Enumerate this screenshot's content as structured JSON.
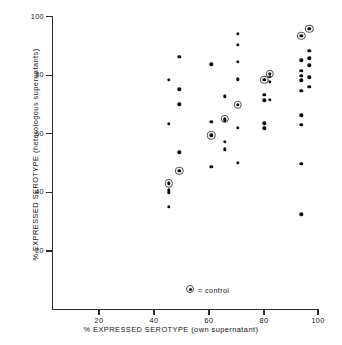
{
  "chart_data": {
    "type": "scatter",
    "title": "",
    "xlabel": "% EXPRESSED SEROTYPE (own supernatant)",
    "ylabel": "% EXPRESSED SEROTYPE (heterologous supernatants)",
    "xlim": [
      0,
      100
    ],
    "ylim": [
      0,
      100
    ],
    "xticks": [
      20,
      40,
      60,
      80,
      100
    ],
    "yticks": [
      20,
      40,
      60,
      80,
      100
    ],
    "xtick_labels": [
      "20",
      "40",
      "60",
      "80",
      "100"
    ],
    "ytick_labels": [
      "20",
      "40",
      "60",
      "80",
      "100"
    ],
    "grid": false,
    "legend_position": "inside-bottom-center",
    "legend": [
      {
        "marker": "circled-dot",
        "label": "= control"
      }
    ],
    "series": [
      {
        "name": "samples",
        "marker": "filled-dot",
        "color": "#0d0d0d",
        "points": [
          [
            44,
            78.3
          ],
          [
            44,
            63.2
          ],
          [
            44,
            42.9
          ],
          [
            44,
            40.6
          ],
          [
            44,
            39.7
          ],
          [
            44,
            34.8
          ],
          [
            48,
            86.0
          ],
          [
            48,
            75.0
          ],
          [
            48,
            69.8
          ],
          [
            48,
            53.4
          ],
          [
            48,
            47.2
          ],
          [
            60,
            83.5
          ],
          [
            60,
            63.9
          ],
          [
            60,
            59.3
          ],
          [
            60,
            48.5
          ],
          [
            65,
            72.5
          ],
          [
            65,
            64.8
          ],
          [
            65,
            64.3
          ],
          [
            65,
            57.0
          ],
          [
            65,
            54.5
          ],
          [
            70,
            94.0
          ],
          [
            70,
            90.2
          ],
          [
            70,
            84.3
          ],
          [
            70,
            78.4
          ],
          [
            70,
            69.7
          ],
          [
            70,
            61.8
          ],
          [
            70,
            49.8
          ],
          [
            80,
            78.2
          ],
          [
            80,
            73.0
          ],
          [
            80,
            71.2
          ],
          [
            80,
            63.3
          ],
          [
            80,
            61.6
          ],
          [
            82,
            80.3
          ],
          [
            82,
            79.2
          ],
          [
            82,
            77.5
          ],
          [
            82,
            71.3
          ],
          [
            94,
            93.2
          ],
          [
            94,
            84.9
          ],
          [
            94,
            81.2
          ],
          [
            94,
            79.6
          ],
          [
            94,
            78.0
          ],
          [
            94,
            74.4
          ],
          [
            94,
            66.1
          ],
          [
            94,
            62.9
          ],
          [
            94,
            49.5
          ],
          [
            94,
            32.2
          ],
          [
            97,
            95.6
          ],
          [
            97,
            88.2
          ],
          [
            97,
            85.6
          ],
          [
            97,
            83.2
          ],
          [
            97,
            79.1
          ],
          [
            97,
            75.8
          ]
        ]
      },
      {
        "name": "control",
        "marker": "circled-dot",
        "color": "#0d0d0d",
        "points": [
          [
            44,
            42.9
          ],
          [
            48,
            47.2
          ],
          [
            60,
            59.3
          ],
          [
            65,
            64.8
          ],
          [
            70,
            69.7
          ],
          [
            80,
            78.2
          ],
          [
            82,
            80.3
          ],
          [
            94,
            93.2
          ],
          [
            97,
            95.6
          ]
        ]
      }
    ]
  },
  "axes": {
    "y_axis_name": "y-axis",
    "x_axis_name": "x-axis"
  }
}
